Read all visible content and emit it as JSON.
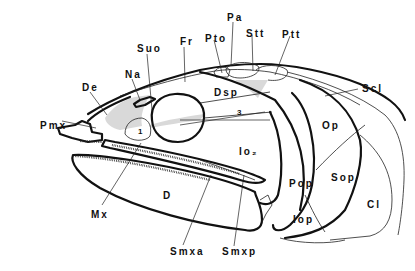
{
  "figure": {
    "labels": [
      {
        "id": "pmx",
        "text": "Pmx",
        "x": 40,
        "y": 121
      },
      {
        "id": "de",
        "text": "De",
        "x": 82,
        "y": 86
      },
      {
        "id": "na",
        "text": "Na",
        "x": 125,
        "y": 74
      },
      {
        "id": "suo",
        "text": "Suo",
        "x": 137,
        "y": 48
      },
      {
        "id": "fr",
        "text": "Fr",
        "x": 180,
        "y": 41
      },
      {
        "id": "pto",
        "text": "Pto",
        "x": 205,
        "y": 34
      },
      {
        "id": "pa",
        "text": "Pa",
        "x": 227,
        "y": 16
      },
      {
        "id": "stt",
        "text": "Stt",
        "x": 246,
        "y": 29
      },
      {
        "id": "ptt",
        "text": "Ptt",
        "x": 282,
        "y": 30
      },
      {
        "id": "scl",
        "text": "Scl",
        "x": 362,
        "y": 84
      },
      {
        "id": "dsp",
        "text": "Dsp",
        "x": 214,
        "y": 88
      },
      {
        "id": "n3",
        "text": "3",
        "x": 237,
        "y": 109,
        "small": true
      },
      {
        "id": "n1",
        "text": "1",
        "x": 138,
        "y": 128,
        "small": true
      },
      {
        "id": "io2",
        "text": "Io₂",
        "x": 239,
        "y": 147
      },
      {
        "id": "op",
        "text": "Op",
        "x": 322,
        "y": 121
      },
      {
        "id": "pop",
        "text": "Pop",
        "x": 289,
        "y": 179
      },
      {
        "id": "sop",
        "text": "Sop",
        "x": 331,
        "y": 173
      },
      {
        "id": "iop",
        "text": "Iop",
        "x": 293,
        "y": 215
      },
      {
        "id": "cl",
        "text": "Cl",
        "x": 367,
        "y": 200
      },
      {
        "id": "d",
        "text": "D",
        "x": 163,
        "y": 191
      },
      {
        "id": "mx",
        "text": "Mx",
        "x": 91,
        "y": 214
      },
      {
        "id": "smxa",
        "text": "Smxa",
        "x": 170,
        "y": 250
      },
      {
        "id": "smxp",
        "text": "Smxp",
        "x": 222,
        "y": 250
      }
    ]
  }
}
